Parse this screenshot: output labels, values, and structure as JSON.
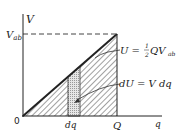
{
  "diagram": {
    "axes": {
      "y_label": "V",
      "x_label": "q",
      "origin_label": "0"
    },
    "ticks": {
      "v_ab": "V",
      "v_ab_sub": "ab",
      "dq": "dq",
      "Q": "Q"
    },
    "annotations": {
      "total_energy": {
        "prefix": "U = ",
        "frac_num": "1",
        "frac_den": "2",
        "body": "QV",
        "sub": "ab"
      },
      "strip_energy": "dU = V dq"
    },
    "colors": {
      "line": "#222222",
      "hatch": "#444444",
      "strip_fill": "#cfcfcf"
    }
  }
}
